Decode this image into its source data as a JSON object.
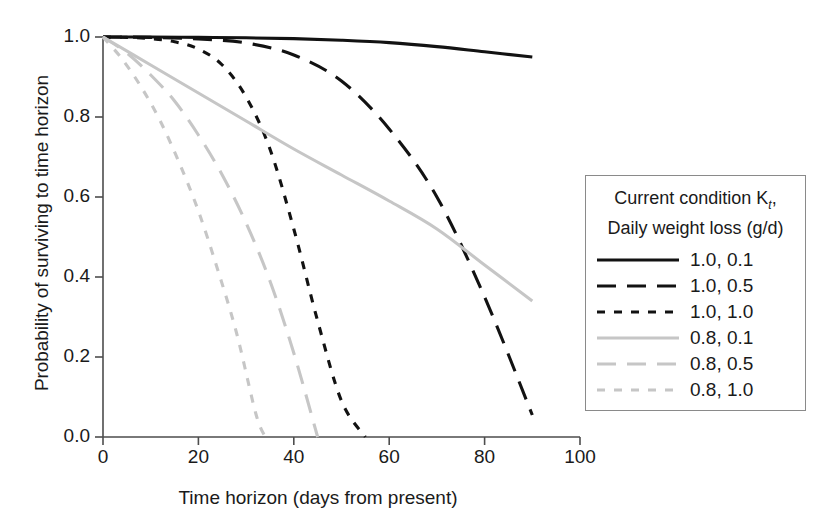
{
  "chart_data": {
    "type": "line",
    "title": "",
    "xlabel": "Time horizon (days from present)",
    "ylabel": "Probability of surviving to time horizon",
    "xlim": [
      0,
      100
    ],
    "ylim": [
      0.0,
      1.0
    ],
    "xticks": [
      "0",
      "20",
      "40",
      "60",
      "80",
      "100"
    ],
    "xtick_values": [
      0,
      20,
      40,
      60,
      80,
      100
    ],
    "yticks": [
      "0.0",
      "0.2",
      "0.4",
      "0.6",
      "0.8",
      "1.0"
    ],
    "ytick_values": [
      0.0,
      0.2,
      0.4,
      0.6,
      0.8,
      1.0
    ],
    "grid": false,
    "legend_position": "right-outside",
    "legend_title_line1": "Current condition K",
    "legend_title_sub": "t",
    "legend_title_line1_tail": ",",
    "legend_title_line2": "Daily weight loss (g/d)",
    "series": [
      {
        "name": "1.0, 0.1",
        "condition": 1.0,
        "weight_loss": 0.1,
        "color": "#121212",
        "style": "solid",
        "x": [
          0,
          10,
          20,
          30,
          40,
          50,
          60,
          70,
          80,
          90
        ],
        "values": [
          1.0,
          1.0,
          0.999,
          0.998,
          0.996,
          0.992,
          0.986,
          0.976,
          0.963,
          0.95
        ]
      },
      {
        "name": "1.0, 0.5",
        "condition": 1.0,
        "weight_loss": 0.5,
        "color": "#121212",
        "style": "long-dash",
        "x": [
          0,
          10,
          20,
          30,
          40,
          50,
          60,
          70,
          80,
          90
        ],
        "values": [
          1.0,
          0.999,
          0.995,
          0.985,
          0.955,
          0.89,
          0.77,
          0.6,
          0.35,
          0.055
        ]
      },
      {
        "name": "1.0, 1.0",
        "condition": 1.0,
        "weight_loss": 1.0,
        "color": "#121212",
        "style": "dotted",
        "x": [
          0,
          5,
          10,
          15,
          20,
          25,
          30,
          35,
          40,
          45,
          50,
          55
        ],
        "values": [
          1.0,
          0.999,
          0.996,
          0.988,
          0.97,
          0.93,
          0.85,
          0.72,
          0.52,
          0.29,
          0.09,
          0.0
        ]
      },
      {
        "name": "0.8, 0.1",
        "condition": 0.8,
        "weight_loss": 0.1,
        "color": "#c6c6c6",
        "style": "solid",
        "x": [
          0,
          10,
          20,
          30,
          40,
          50,
          60,
          70,
          80,
          90
        ],
        "values": [
          1.0,
          0.93,
          0.86,
          0.79,
          0.72,
          0.655,
          0.59,
          0.52,
          0.43,
          0.34
        ]
      },
      {
        "name": "0.8, 0.5",
        "condition": 0.8,
        "weight_loss": 0.5,
        "color": "#c6c6c6",
        "style": "long-dash",
        "x": [
          0,
          5,
          10,
          15,
          20,
          25,
          30,
          35,
          40,
          45
        ],
        "values": [
          1.0,
          0.96,
          0.905,
          0.84,
          0.755,
          0.655,
          0.535,
          0.39,
          0.21,
          0.0
        ]
      },
      {
        "name": "0.8, 1.0",
        "condition": 0.8,
        "weight_loss": 1.0,
        "color": "#c6c6c6",
        "style": "dotted",
        "x": [
          0,
          4,
          8,
          12,
          16,
          20,
          24,
          28,
          32,
          34
        ],
        "values": [
          1.0,
          0.945,
          0.875,
          0.79,
          0.685,
          0.565,
          0.42,
          0.26,
          0.06,
          0.0
        ]
      }
    ]
  }
}
